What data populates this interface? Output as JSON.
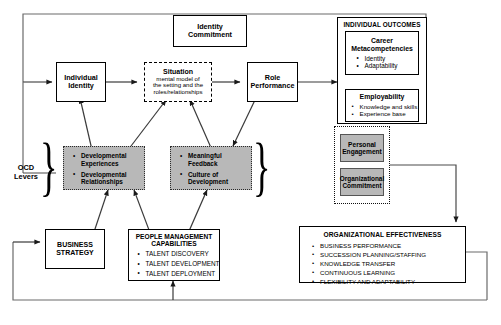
{
  "diagram": {
    "nodes": {
      "identity_commitment": {
        "label": "Identity\nCommitment",
        "line1": "Identity",
        "line2": "Commitment"
      },
      "individual_identity": {
        "line1": "Individual",
        "line2": "Identity"
      },
      "situation": {
        "title": "Situation",
        "sub1": "mental model of",
        "sub2": "the setting and the",
        "sub3": "roles/relationships"
      },
      "role_performance": {
        "line1": "Role",
        "line2": "Performance"
      },
      "individual_outcomes": {
        "header": "INDIVIDUAL OUTCOMES"
      },
      "career_metacompetencies": {
        "line1": "Career",
        "line2": "Metacompetencies",
        "bullets": [
          "Identity",
          "Adaptability"
        ]
      },
      "employability": {
        "title": "Employability",
        "bullets": [
          "Knowledge and skills",
          "Experience base"
        ]
      },
      "personal_engagement": {
        "line1": "Personal",
        "line2": "Engagement"
      },
      "organizational_commitment": {
        "line1": "Organizational",
        "line2": "Commitment"
      },
      "developmental": {
        "bullets": [
          "Developmental\nExperiences",
          "Developmental\nRelationships"
        ],
        "b1l1": "Developmental",
        "b1l2": "Experiences",
        "b2l1": "Developmental",
        "b2l2": "Relationships"
      },
      "feedback_culture": {
        "b1l1": "Meaningful",
        "b1l2": "Feedback",
        "b2l1": "Culture of",
        "b2l2": "Development"
      },
      "ocd_levers": {
        "line1": "OCD",
        "line2": "Levers"
      },
      "business_strategy": {
        "line1": "BUSINESS",
        "line2": "STRATEGY"
      },
      "people_management": {
        "line1": "PEOPLE MANAGEMENT",
        "line2": "CAPABILITIES",
        "bullets": [
          "TALENT DISCOVERY",
          "TALENT DEVELOPMENT",
          "TALENT DEPLOYMENT"
        ]
      },
      "organizational_effectiveness": {
        "header": "ORGANIZATIONAL EFFECTIVENESS",
        "bullets": [
          "BUSINESS PERFORMANCE",
          "SUCCESSION PLANNING/STAFFING",
          "KNOWLEDGE TRANSFER",
          "CONTINUOUS LEARNING",
          "FLEXIBILITY AND ADAPTABILITY"
        ]
      }
    },
    "colors": {
      "shaded_fill": "#b8b8b8",
      "line": "#000000",
      "background": "#ffffff"
    }
  }
}
